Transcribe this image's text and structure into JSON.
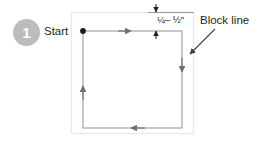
{
  "figure": {
    "type": "instructional-diagram",
    "step_number": "1",
    "labels": {
      "start": "Start",
      "block_line": "Block line",
      "dimension": "¼– ½\""
    },
    "colors": {
      "badge_fill": "#bcbcbc",
      "badge_text": "#ffffff",
      "text": "#231f20",
      "stitch_line": "#8c8c8c",
      "frame_line": "#e6e6e6",
      "leader_line": "#3d3d3d",
      "background": "#ffffff"
    }
  },
  "diagram_data": {
    "fabric_frame": {
      "x": 71,
      "y": 12,
      "width": 123,
      "height": 122
    },
    "stitch_path": {
      "x": 83,
      "y": 31,
      "width": 99,
      "height": 97,
      "direction": "counter-clockwise",
      "start_point": {
        "x": 83,
        "y": 31
      }
    },
    "direction_arrows": [
      {
        "side": "top",
        "points": "right",
        "x": 129,
        "y": 31
      },
      {
        "side": "right",
        "points": "down",
        "x": 182,
        "y": 70
      },
      {
        "side": "bottom",
        "points": "left",
        "x": 132,
        "y": 128
      },
      {
        "side": "left",
        "points": "up",
        "x": 83,
        "y": 87
      }
    ],
    "dimension_marker": {
      "x": 156,
      "top_y": 12,
      "bottom_y": 31,
      "value": "¼– ½\"",
      "reference_line_y": 12
    },
    "leader_line": {
      "from": {
        "x": 214,
        "y": 30
      },
      "to": {
        "x": 190,
        "y": 54
      },
      "target": "block-line-edge"
    }
  }
}
